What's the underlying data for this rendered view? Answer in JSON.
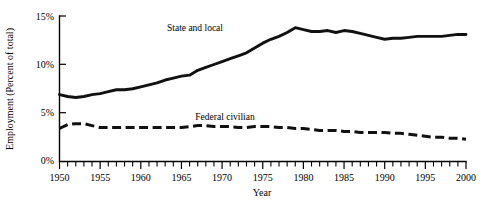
{
  "chart_data": {
    "type": "line",
    "title": "",
    "xlabel": "Year",
    "ylabel": "Employment (Percent of total)",
    "xlim": [
      1950,
      2000
    ],
    "ylim": [
      0,
      15
    ],
    "grid": false,
    "legend_position": "inline-annotation",
    "y_tick_labels": [
      "0%",
      "5%",
      "10%",
      "15%"
    ],
    "y_tick_values": [
      0,
      5,
      10,
      15
    ],
    "x_tick_labels": [
      "1950",
      "1955",
      "1960",
      "1965",
      "1970",
      "1975",
      "1980",
      "1985",
      "1990",
      "1995",
      "2000"
    ],
    "x_tick_values": [
      1950,
      1955,
      1960,
      1965,
      1970,
      1975,
      1980,
      1985,
      1990,
      1995,
      2000
    ],
    "x_minor_tick_interval": 1,
    "x": [
      1950,
      1951,
      1952,
      1953,
      1954,
      1955,
      1956,
      1957,
      1958,
      1959,
      1960,
      1961,
      1962,
      1963,
      1964,
      1965,
      1966,
      1967,
      1968,
      1969,
      1970,
      1971,
      1972,
      1973,
      1974,
      1975,
      1976,
      1977,
      1978,
      1979,
      1980,
      1981,
      1982,
      1983,
      1984,
      1985,
      1986,
      1987,
      1988,
      1989,
      1990,
      1991,
      1992,
      1993,
      1994,
      1995,
      1996,
      1997,
      1998,
      1999,
      2000
    ],
    "series": [
      {
        "name": "State and local",
        "style": "solid",
        "color": "#111111",
        "label_text": "State and local",
        "values": [
          6.9,
          6.7,
          6.6,
          6.7,
          6.9,
          7.0,
          7.2,
          7.4,
          7.4,
          7.5,
          7.7,
          7.9,
          8.1,
          8.4,
          8.6,
          8.8,
          8.9,
          9.4,
          9.7,
          10.0,
          10.3,
          10.6,
          10.9,
          11.2,
          11.7,
          12.2,
          12.6,
          12.9,
          13.3,
          13.8,
          13.6,
          13.4,
          13.4,
          13.5,
          13.3,
          13.5,
          13.4,
          13.2,
          13.0,
          12.8,
          12.6,
          12.7,
          12.7,
          12.8,
          12.9,
          12.9,
          12.9,
          12.9,
          13.0,
          13.1,
          13.1
        ]
      },
      {
        "name": "Federal civilian",
        "style": "dashed",
        "color": "#111111",
        "label_text": "Federal civilian",
        "values": [
          3.4,
          3.8,
          3.9,
          3.9,
          3.7,
          3.5,
          3.5,
          3.5,
          3.5,
          3.5,
          3.5,
          3.5,
          3.5,
          3.5,
          3.5,
          3.5,
          3.6,
          3.7,
          3.7,
          3.6,
          3.6,
          3.6,
          3.5,
          3.5,
          3.6,
          3.6,
          3.6,
          3.5,
          3.5,
          3.4,
          3.4,
          3.3,
          3.2,
          3.2,
          3.2,
          3.1,
          3.1,
          3.0,
          3.0,
          3.0,
          3.0,
          2.9,
          2.9,
          2.8,
          2.7,
          2.6,
          2.5,
          2.5,
          2.4,
          2.4,
          2.3
        ]
      }
    ],
    "annotations": [
      {
        "text": "State and local",
        "x_px": 195,
        "y_px": 31
      },
      {
        "text": "Federal civilian",
        "x_px": 225,
        "y_px": 120
      }
    ]
  },
  "figure": {
    "background_color": "#ffffff",
    "line_color": "#111111"
  }
}
